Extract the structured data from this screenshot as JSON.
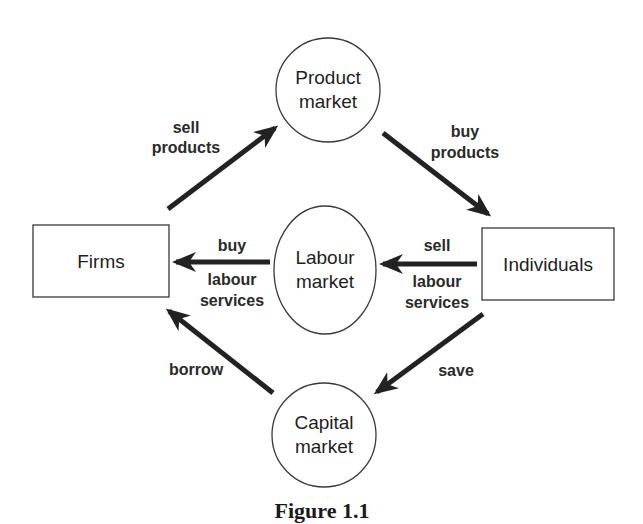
{
  "diagram": {
    "type": "circular-flow",
    "nodes": {
      "firms": {
        "label": "Firms",
        "shape": "rectangle"
      },
      "individuals": {
        "label": "Individuals",
        "shape": "rectangle"
      },
      "product_market": {
        "line1": "Product",
        "line2": "market",
        "shape": "circle"
      },
      "labour_market": {
        "line1": "Labour",
        "line2": "market",
        "shape": "ellipse"
      },
      "capital_market": {
        "line1": "Capital",
        "line2": "market",
        "shape": "circle"
      }
    },
    "flows": {
      "sell_products": {
        "line1": "sell",
        "line2": "products",
        "from": "Firms",
        "to": "Product market"
      },
      "buy_products": {
        "line1": "buy",
        "line2": "products",
        "from": "Product market",
        "to": "Individuals"
      },
      "buy_labour": {
        "line1": "buy",
        "line2": "labour",
        "line3": "services",
        "from": "Labour market",
        "to": "Firms"
      },
      "sell_labour": {
        "line1": "sell",
        "line2": "labour",
        "line3": "services",
        "from": "Individuals",
        "to": "Labour market"
      },
      "borrow": {
        "line1": "borrow",
        "from": "Capital market",
        "to": "Firms"
      },
      "save": {
        "line1": "save",
        "from": "Individuals",
        "to": "Capital market"
      }
    },
    "caption": "Figure 1.1",
    "colors": {
      "stroke": "#222222",
      "text": "#1e1e1e",
      "background": "#ffffff"
    }
  }
}
